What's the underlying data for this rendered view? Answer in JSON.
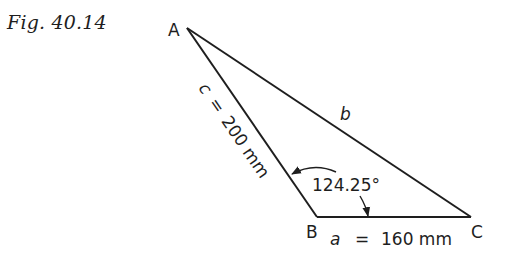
{
  "figure": {
    "caption": "Fig. 40.14",
    "vertices": [
      {
        "label": "A",
        "x": 187,
        "y": 28
      },
      {
        "label": "B",
        "x": 317,
        "y": 217
      },
      {
        "label": "C",
        "x": 471,
        "y": 217
      }
    ],
    "sides": {
      "a": {
        "label": "a",
        "eq": "=",
        "value": "160 mm"
      },
      "b": {
        "label": "b"
      },
      "c": {
        "label": "c",
        "eq": "=",
        "value": "200 mm"
      }
    },
    "angle_B": {
      "value": "124.25°"
    },
    "colors": {
      "ink": "#1e1e1e",
      "background": "#ffffff"
    }
  }
}
